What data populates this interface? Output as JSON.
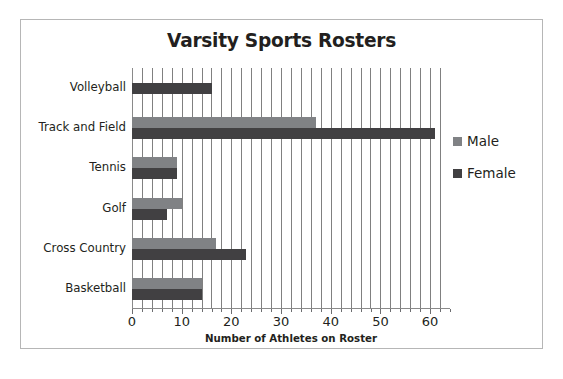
{
  "chart_data": {
    "type": "bar",
    "orientation": "horizontal",
    "title": "Varsity Sports Rosters",
    "xlabel": "Number of Athletes on Roster",
    "ylabel": "",
    "categories": [
      "Volleyball",
      "Track and Field",
      "Tennis",
      "Golf",
      "Cross Country",
      "Basketball"
    ],
    "series": [
      {
        "name": "Male",
        "color": "#808285",
        "values": [
          null,
          37,
          9,
          10,
          17,
          14
        ]
      },
      {
        "name": "Female",
        "color": "#414042",
        "values": [
          16,
          61,
          9,
          7,
          23,
          14
        ]
      }
    ],
    "xlim": [
      0,
      64
    ],
    "xticks": [
      0,
      10,
      20,
      30,
      40,
      50,
      60
    ],
    "xtick_labels": [
      "0",
      "10",
      "20",
      "30",
      "40",
      "50",
      "60"
    ],
    "minor_tick_step": 2,
    "grid": "vertical-minor",
    "legend_position": "right",
    "legend": [
      "Male",
      "Female"
    ]
  },
  "legend": {
    "entries": [
      {
        "label": "Male",
        "swatch": "male-swatch"
      },
      {
        "label": "Female",
        "swatch": "female-swatch"
      }
    ]
  }
}
